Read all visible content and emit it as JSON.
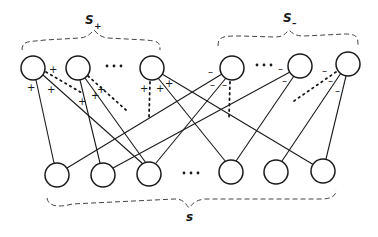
{
  "diagram": {
    "labels": {
      "s_plus": {
        "base": "S",
        "sub": "+"
      },
      "s_minus": {
        "base": "S",
        "sub": "–"
      },
      "s": {
        "base": "s"
      }
    },
    "ellipsis": "• • •",
    "top_nodes": [
      {
        "id": "sp1",
        "group": "S+",
        "x": 33,
        "y": 68
      },
      {
        "id": "sp2",
        "group": "S+",
        "x": 78,
        "y": 68
      },
      {
        "id": "sp3",
        "group": "S+",
        "x": 152,
        "y": 68
      },
      {
        "id": "sm1",
        "group": "S-",
        "x": 232,
        "y": 68
      },
      {
        "id": "sm2",
        "group": "S-",
        "x": 300,
        "y": 66
      },
      {
        "id": "sm3",
        "group": "S-",
        "x": 348,
        "y": 64
      }
    ],
    "bottom_nodes": [
      {
        "id": "b1",
        "x": 57,
        "y": 175
      },
      {
        "id": "b2",
        "x": 103,
        "y": 175
      },
      {
        "id": "b3",
        "x": 149,
        "y": 174
      },
      {
        "id": "b4",
        "x": 231,
        "y": 172
      },
      {
        "id": "b5",
        "x": 276,
        "y": 172
      },
      {
        "id": "b6",
        "x": 323,
        "y": 171
      }
    ],
    "edges": [
      {
        "from": "sp1",
        "to": "b1",
        "sign": "+"
      },
      {
        "from": "sp1",
        "to": "b3",
        "sign": "+"
      },
      {
        "from": "sp2",
        "to": "b2",
        "sign": "+"
      },
      {
        "from": "sp2",
        "to": "b3",
        "sign": "+"
      },
      {
        "from": "sp3",
        "to": "b4",
        "sign": "+"
      },
      {
        "from": "sp3",
        "to": "b6",
        "sign": "+"
      },
      {
        "from": "sm1",
        "to": "b1",
        "sign": "-"
      },
      {
        "from": "sm1",
        "to": "b3",
        "sign": "-"
      },
      {
        "from": "sm2",
        "to": "b2",
        "sign": "-"
      },
      {
        "from": "sm2",
        "to": "b4",
        "sign": "-"
      },
      {
        "from": "sm3",
        "to": "b5",
        "sign": "-"
      },
      {
        "from": "sm3",
        "to": "b6",
        "sign": "-"
      }
    ],
    "signs": {
      "plus": "+",
      "minus": "–"
    }
  }
}
